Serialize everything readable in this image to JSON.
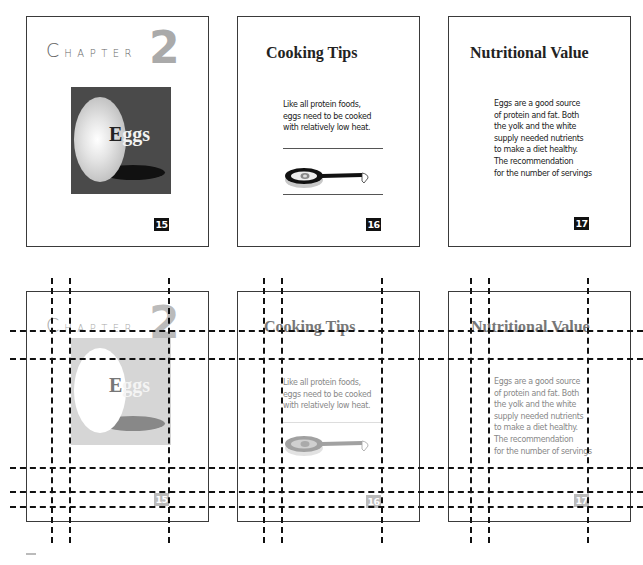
{
  "pages": [
    {
      "chapter_label_initial": "C",
      "chapter_label_rest": "HAPTER",
      "chapter_number": "2",
      "image_caption_initial": "E",
      "image_caption_rest": "ggs",
      "page_number": "15"
    },
    {
      "heading": "Cooking Tips",
      "body_lines": [
        "Like all protein foods,",
        "eggs need to be cooked",
        "with relatively low heat."
      ],
      "illustration": "frying-pan-with-egg",
      "page_number": "16"
    },
    {
      "heading": "Nutritional Value",
      "body_lines": [
        "Eggs are a good source",
        "of protein and fat. Both",
        "the yolk and the white",
        "supply needed nutrients",
        "to make a diet healthy.",
        "The recommendation",
        "for the number of servings"
      ],
      "page_number": "17"
    }
  ],
  "rows": [
    {
      "name": "final-layout",
      "style": "normal"
    },
    {
      "name": "grid-overlay",
      "style": "ghost-with-guides"
    }
  ],
  "colors": {
    "frame_border": "#3a3a3a",
    "guide_line": "#111111",
    "image_background": "#4a4a4a",
    "ghost_image_background": "#d6d6d6"
  }
}
